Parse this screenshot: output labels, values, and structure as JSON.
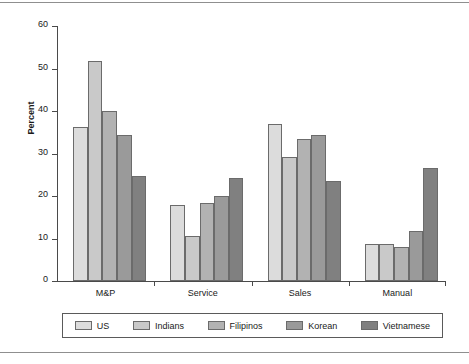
{
  "chart_data": {
    "type": "bar",
    "title": "",
    "xlabel": "",
    "ylabel": "Percent",
    "ylim": [
      0,
      60
    ],
    "yticks": [
      0,
      10,
      20,
      30,
      40,
      50,
      60
    ],
    "grid": false,
    "legend_position": "bottom",
    "categories": [
      "M&P",
      "Service",
      "Sales",
      "Manual"
    ],
    "series": [
      {
        "name": "US",
        "color": "#dcdcdc",
        "values": [
          36.3,
          17.9,
          37.0,
          8.8
        ]
      },
      {
        "name": "Indians",
        "color": "#c9c9c9",
        "values": [
          51.7,
          10.5,
          29.2,
          8.8
        ]
      },
      {
        "name": "Filipinos",
        "color": "#b2b2b2",
        "values": [
          40.0,
          18.3,
          33.5,
          8.1
        ]
      },
      {
        "name": "Korean",
        "color": "#9a9a9a",
        "values": [
          34.3,
          19.9,
          34.3,
          11.8
        ]
      },
      {
        "name": "Vietnamese",
        "color": "#808080",
        "values": [
          24.8,
          24.3,
          23.5,
          26.7
        ]
      }
    ]
  },
  "legend": {
    "entries": [
      "US",
      "Indians",
      "Filipinos",
      "Korean",
      "Vietnamese"
    ]
  }
}
